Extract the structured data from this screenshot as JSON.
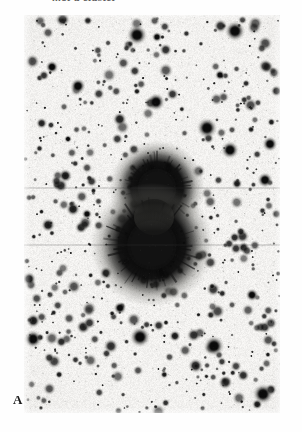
{
  "figure": {
    "kind": "astronomical-photographic-plate",
    "caption_top": "...of a cluster",
    "panel_label": "A",
    "orientation": "negative",
    "background_color": "#f2f1ef",
    "ink_color": "#121212",
    "plate": {
      "left": 24,
      "top": 15,
      "width": 256,
      "height": 398
    }
  },
  "chart_data": {
    "type": "scatter",
    "title": "",
    "subtitle": "",
    "xlabel": "",
    "ylabel": "",
    "xlim": [
      0,
      256
    ],
    "ylim": [
      0,
      398
    ],
    "grid": false,
    "legend": null,
    "annotations": [
      {
        "text": "A",
        "x": -11,
        "y": 378
      }
    ],
    "series": [
      {
        "name": "saturated-core-objects",
        "marker": "filled-disk-with-diffraction-spikes",
        "color": "#0d0d0d",
        "points": [
          {
            "x": 133,
            "y": 173,
            "r": 21,
            "spike": 30
          },
          {
            "x": 128,
            "y": 230,
            "r": 27,
            "spike": 38
          }
        ]
      },
      {
        "name": "bright-stars",
        "marker": "filled-disk",
        "color": "#111111",
        "points": [
          {
            "x": 211,
            "y": 16,
            "r": 8
          },
          {
            "x": 113,
            "y": 20,
            "r": 8
          },
          {
            "x": 133,
            "y": 22,
            "r": 4
          },
          {
            "x": 132,
            "y": 87,
            "r": 7
          },
          {
            "x": 54,
            "y": 71,
            "r": 6
          },
          {
            "x": 44,
            "y": 124,
            "r": 3
          },
          {
            "x": 206,
            "y": 135,
            "r": 7
          },
          {
            "x": 183,
            "y": 113,
            "r": 8
          },
          {
            "x": 246,
            "y": 129,
            "r": 6
          },
          {
            "x": 116,
            "y": 322,
            "r": 8
          },
          {
            "x": 190,
            "y": 331,
            "r": 8
          },
          {
            "x": 9,
            "y": 324,
            "r": 7
          },
          {
            "x": 239,
            "y": 379,
            "r": 8
          },
          {
            "x": 96,
            "y": 293,
            "r": 5
          },
          {
            "x": 241,
            "y": 165,
            "r": 6
          },
          {
            "x": 110,
            "y": 189,
            "r": 5
          },
          {
            "x": 82,
            "y": 258,
            "r": 5
          },
          {
            "x": 175,
            "y": 241,
            "r": 5
          },
          {
            "x": 63,
            "y": 199,
            "r": 4
          },
          {
            "x": 28,
            "y": 52,
            "r": 5
          },
          {
            "x": 196,
            "y": 60,
            "r": 4
          },
          {
            "x": 228,
            "y": 280,
            "r": 5
          }
        ]
      },
      {
        "name": "faint-field-stars",
        "marker": "filled-disk",
        "color": "#3a3a3a",
        "count": 620,
        "radius_range": [
          0.7,
          3.6
        ]
      }
    ]
  }
}
